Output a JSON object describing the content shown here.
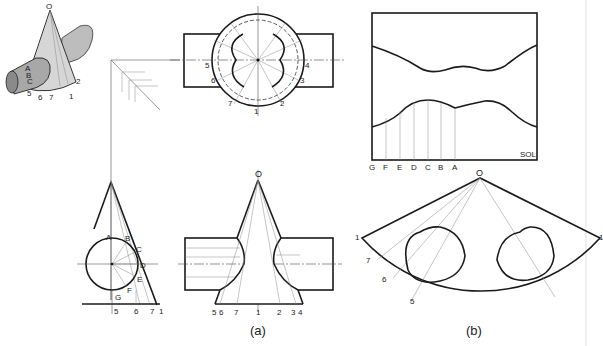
{
  "figure": {
    "part_a_caption": "(a)",
    "part_b_caption": "(b)",
    "apex_label": "O",
    "development_label": "SOL"
  },
  "pictorial": {
    "apex": "O",
    "labels": [
      "A",
      "B",
      "C",
      "5",
      "6",
      "7",
      "1",
      "2"
    ]
  },
  "top_view": {
    "labels": [
      "5",
      "6",
      "7",
      "1",
      "2",
      "3",
      "4"
    ]
  },
  "side_view": {
    "circle_labels": [
      "A",
      "B",
      "C",
      "D",
      "E",
      "F",
      "G"
    ],
    "base_labels": [
      "5",
      "6",
      "7",
      "1"
    ]
  },
  "front_view": {
    "apex": "O",
    "base_labels": [
      "5",
      "6",
      "7",
      "1",
      "2",
      "3",
      "4"
    ]
  },
  "cylinder_development": {
    "title": "SOL",
    "bottom_labels": [
      "G",
      "F",
      "E",
      "D",
      "C",
      "B",
      "A"
    ]
  },
  "cone_development": {
    "apex": "O",
    "labels": [
      "1",
      "7",
      "6",
      "5",
      "1"
    ]
  }
}
